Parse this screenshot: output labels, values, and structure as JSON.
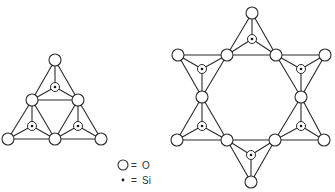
{
  "style": {
    "background": "#ffffff",
    "stroke": "#2b2b2b",
    "o_radius": 6,
    "si_ring_radius": 4.5,
    "si_dot_radius": 1.3
  },
  "legend": {
    "items": [
      {
        "symbol": "circle",
        "equals": "=",
        "label": "O",
        "symbol_pos": [
          123,
          165
        ],
        "equals_x": 131,
        "label_x": 142,
        "text_y": 168.5
      },
      {
        "symbol": "dot",
        "equals": "=",
        "label": "Si",
        "symbol_pos": [
          123,
          180
        ],
        "equals_x": 131,
        "label_x": 142,
        "text_y": 183.5
      }
    ]
  },
  "structures": [
    {
      "name": "three-membered-ring",
      "o_atoms": [
        [
          55,
          60
        ],
        [
          32,
          100
        ],
        [
          78,
          100
        ],
        [
          8,
          139
        ],
        [
          55,
          139
        ],
        [
          101,
          139
        ]
      ],
      "tetrahedra": [
        {
          "corners": [
            0,
            1,
            2
          ],
          "si": [
            55,
            87
          ]
        },
        {
          "corners": [
            1,
            3,
            4
          ],
          "si": [
            32,
            126
          ]
        },
        {
          "corners": [
            2,
            4,
            5
          ],
          "si": [
            78,
            126
          ]
        }
      ]
    },
    {
      "name": "six-membered-ring",
      "o_atoms": [
        [
          252,
          13
        ],
        [
          227,
          55
        ],
        [
          276,
          55
        ],
        [
          325,
          55
        ],
        [
          301,
          97
        ],
        [
          324,
          140
        ],
        [
          275,
          140
        ],
        [
          251,
          182
        ],
        [
          227,
          140
        ],
        [
          177,
          140
        ],
        [
          202,
          97
        ],
        [
          178,
          55
        ]
      ],
      "tetrahedra": [
        {
          "corners": [
            0,
            1,
            2
          ],
          "si": [
            252,
            39
          ]
        },
        {
          "corners": [
            2,
            3,
            4
          ],
          "si": [
            301,
            69
          ]
        },
        {
          "corners": [
            4,
            5,
            6
          ],
          "si": [
            301,
            126
          ]
        },
        {
          "corners": [
            6,
            7,
            8
          ],
          "si": [
            251,
            155
          ]
        },
        {
          "corners": [
            8,
            9,
            10
          ],
          "si": [
            202,
            126
          ]
        },
        {
          "corners": [
            10,
            11,
            1
          ],
          "si": [
            202,
            69
          ]
        }
      ]
    }
  ]
}
